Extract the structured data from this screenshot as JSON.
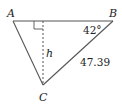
{
  "diagram": {
    "type": "triangle",
    "vertices": {
      "A": {
        "label": "A",
        "x": 13,
        "y": 21
      },
      "B": {
        "label": "B",
        "x": 113,
        "y": 21
      },
      "C": {
        "label": "C",
        "x": 43,
        "y": 85
      }
    },
    "altitude": {
      "label": "h",
      "from": "C",
      "foot_x": 43,
      "foot_y": 21,
      "style": "dashed"
    },
    "right_angle_marker": true,
    "angle_B": {
      "label": "42°"
    },
    "side_BC": {
      "label": "47.39"
    },
    "colors": {
      "line": "#555555",
      "text": "#222222",
      "background": "#ffffff"
    }
  }
}
